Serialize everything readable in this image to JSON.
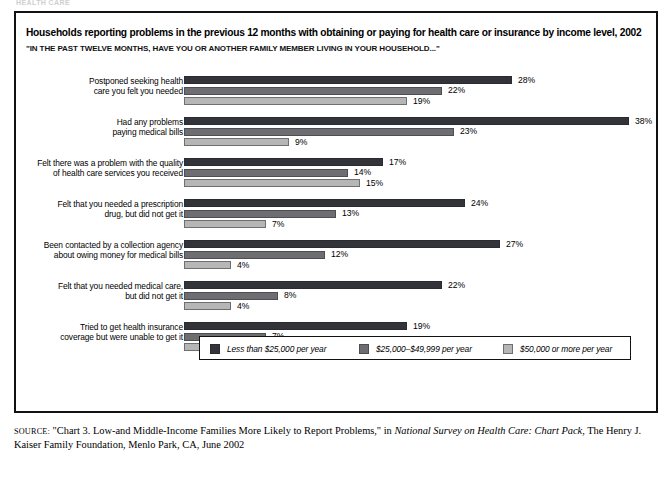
{
  "ghost_header": "HEALTH CARE",
  "title": "Households reporting problems in the previous 12 months with obtaining or paying for health care or insurance by income level, 2002",
  "subtitle": "\"IN THE PAST TWELVE MONTHS, HAVE YOU OR ANOTHER FAMILY MEMBER LIVING IN YOUR HOUSEHOLD...\"",
  "legend": {
    "items": [
      {
        "label": "Less than $25,000 per year",
        "color": "#33333a"
      },
      {
        "label": "$25,000–$49,999 per year",
        "color": "#6e6e72"
      },
      {
        "label": "$50,000 or more per year",
        "color": "#b6b6b6"
      }
    ]
  },
  "source": {
    "label": "SOURCE:",
    "pre": " \"Chart 3. Low-and Middle-Income Families More Likely to Report Problems,\" in ",
    "italic": "National Survey on Health Care: Chart Pack",
    "post": ", The Henry J. Kaiser Family Foundation, Menlo Park, CA, June 2002"
  },
  "chart_data": {
    "type": "bar",
    "orientation": "horizontal",
    "title": "Households reporting problems in the previous 12 months with obtaining or paying for health care or insurance by income level, 2002",
    "subtitle": "\"IN THE PAST TWELVE MONTHS, HAVE YOU OR ANOTHER FAMILY MEMBER LIVING IN YOUR HOUSEHOLD...\"",
    "xlabel": "",
    "ylabel": "",
    "xlim": [
      0,
      38
    ],
    "grid": false,
    "legend_position": "bottom",
    "value_suffix": "%",
    "categories": [
      "Postponed seeking health care you felt you needed",
      "Had any problems paying medical bills",
      "Felt there was a problem with the quality of health care services you received",
      "Felt that you needed a prescription drug, but did not get it",
      "Been contacted by a collection agency about owing money for medical bills",
      "Felt that you needed medical care, but did not get it",
      "Tried to get health insurance coverage but were unable to get it"
    ],
    "category_lines": [
      [
        "Postponed seeking health",
        "care you felt you needed"
      ],
      [
        "Had any problems",
        "paying medical bills"
      ],
      [
        "Felt there was a problem with the quality",
        "of health care services you received"
      ],
      [
        "Felt that you needed a prescription",
        "drug, but did not get it"
      ],
      [
        "Been contacted by a collection agency",
        "about owing money for medical bills"
      ],
      [
        "Felt that you needed medical care,",
        "but did not get it"
      ],
      [
        "Tried to get health insurance",
        "coverage but were unable to get it"
      ]
    ],
    "series": [
      {
        "name": "Less than $25,000 per year",
        "color": "#33333a",
        "values": [
          28,
          38,
          17,
          24,
          27,
          22,
          19
        ]
      },
      {
        "name": "$25,000–$49,999 per year",
        "color": "#6e6e72",
        "values": [
          22,
          23,
          14,
          13,
          12,
          8,
          7
        ]
      },
      {
        "name": "$50,000 or more per year",
        "color": "#b6b6b6",
        "values": [
          19,
          9,
          15,
          7,
          4,
          4,
          3
        ]
      }
    ],
    "value_labels": [
      [
        "28%",
        "22%",
        "19%"
      ],
      [
        "38%",
        "23%",
        "9%"
      ],
      [
        "17%",
        "14%",
        "15%"
      ],
      [
        "24%",
        "13%",
        "7%"
      ],
      [
        "27%",
        "12%",
        "4%"
      ],
      [
        "22%",
        "8%",
        "4%"
      ],
      [
        "19%",
        "7%",
        "3%"
      ]
    ]
  }
}
